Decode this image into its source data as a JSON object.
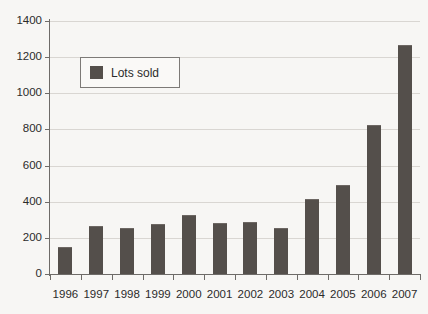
{
  "chart_data": {
    "type": "bar",
    "title": "",
    "xlabel": "",
    "ylabel": "",
    "categories": [
      "1996",
      "1997",
      "1998",
      "1999",
      "2000",
      "2001",
      "2002",
      "2003",
      "2004",
      "2005",
      "2006",
      "2007"
    ],
    "series": [
      {
        "name": "Lots sold",
        "values": [
          148,
          268,
          252,
          275,
          325,
          285,
          290,
          252,
          415,
          490,
          825,
          1265
        ]
      }
    ],
    "ylim": [
      0,
      1400
    ],
    "ytick_labels": [
      "0",
      "200",
      "400",
      "600",
      "800",
      "1000",
      "1200",
      "1400"
    ],
    "ytick_values": [
      0,
      200,
      400,
      600,
      800,
      1000,
      1200,
      1400
    ],
    "grid": true,
    "grid_axis": "y",
    "legend_position": "upper-left-inset",
    "legend_entries": [
      "Lots sold"
    ],
    "colors": {
      "bar": "#544f4b",
      "grid": "#d9d6d2",
      "axis": "#6e6b68",
      "background": "#f7f6f4",
      "text": "#2b2b2b",
      "legend_border": "#7d7a77"
    }
  }
}
